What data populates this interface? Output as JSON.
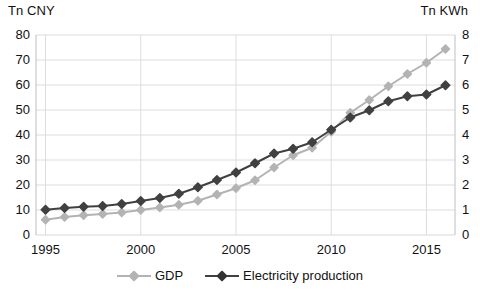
{
  "chart_data": {
    "type": "line",
    "title": "",
    "xlabel": "",
    "left_axis_title": "Tn CNY",
    "right_axis_title": "Tn KWh",
    "x": [
      1995,
      1996,
      1997,
      1998,
      1999,
      2000,
      2001,
      2002,
      2003,
      2004,
      2005,
      2006,
      2007,
      2008,
      2009,
      2010,
      2011,
      2012,
      2013,
      2014,
      2015,
      2016
    ],
    "xlim": [
      1994.5,
      2016.5
    ],
    "xticks": [
      1995,
      2000,
      2005,
      2010,
      2015
    ],
    "grid": true,
    "legend_position": "bottom",
    "series": [
      {
        "name": "GDP",
        "axis": "left",
        "unit": "Tn CNY",
        "color": "#b3b3b3",
        "marker": "diamond",
        "ylim": [
          0,
          80
        ],
        "yticks": [
          0,
          10,
          20,
          30,
          40,
          50,
          60,
          70,
          80
        ],
        "values": [
          6.1,
          7.2,
          7.9,
          8.4,
          9.0,
          10.0,
          11.0,
          12.1,
          13.7,
          16.2,
          18.7,
          21.9,
          27.0,
          31.9,
          34.9,
          41.3,
          48.9,
          54.0,
          59.5,
          64.4,
          68.9,
          74.4
        ]
      },
      {
        "name": "Electricity production",
        "axis": "right",
        "unit": "Tn KWh",
        "color": "#404040",
        "marker": "diamond",
        "ylim": [
          0,
          8
        ],
        "yticks": [
          0,
          1,
          2,
          3,
          4,
          5,
          6,
          7,
          8
        ],
        "values": [
          1.01,
          1.08,
          1.13,
          1.16,
          1.24,
          1.36,
          1.48,
          1.65,
          1.91,
          2.2,
          2.5,
          2.87,
          3.26,
          3.45,
          3.71,
          4.21,
          4.7,
          4.99,
          5.35,
          5.55,
          5.62,
          5.99
        ]
      }
    ]
  },
  "legend": {
    "entries": [
      {
        "label": "GDP"
      },
      {
        "label": "Electricity production"
      }
    ]
  }
}
